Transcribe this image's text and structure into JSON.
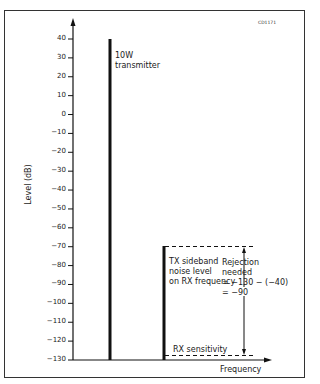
{
  "figure_code": "CD1171",
  "chart_data": {
    "type": "bar",
    "title": "",
    "xlabel": "Frequency",
    "ylabel": "Level (dB)",
    "ylim": [
      -130,
      40
    ],
    "yticks": [
      40,
      30,
      20,
      10,
      0,
      -10,
      -20,
      -30,
      -40,
      -50,
      -60,
      -70,
      -80,
      -90,
      -100,
      -110,
      -120,
      -130
    ],
    "grid": false,
    "series": [
      {
        "name": "10W transmitter",
        "value": 40
      },
      {
        "name": "TX sideband noise level on RX frequency",
        "value": -40
      }
    ],
    "reference_lines": [
      {
        "name": "RX sensitivity",
        "value": -130,
        "style": "dashed"
      },
      {
        "name": "TX sideband noise level",
        "value": -40,
        "style": "dashed"
      }
    ],
    "annotations": [
      {
        "text": "10W transmitter"
      },
      {
        "text": "TX sideband noise level on RX frequency"
      },
      {
        "text": "Rejection needed = -130 - (-40) = -90"
      },
      {
        "text": "RX sensitivity"
      }
    ]
  },
  "labels": {
    "tx": [
      "10W",
      "transmitter"
    ],
    "sideband": [
      "TX sideband",
      "noise level",
      "on RX frequency"
    ],
    "rejection": [
      "Rejection",
      "needed",
      "= −130 − (−40)",
      "= −90"
    ],
    "rx_sens": "RX sensitivity",
    "xlabel": "Frequency",
    "ylabel": "Level (dB)",
    "ticks": [
      "40",
      "30",
      "20",
      "10",
      "0",
      "−10",
      "−20",
      "−30",
      "−40",
      "−50",
      "−60",
      "−70",
      "−80",
      "−90",
      "−100",
      "−110",
      "−120",
      "−130"
    ]
  }
}
